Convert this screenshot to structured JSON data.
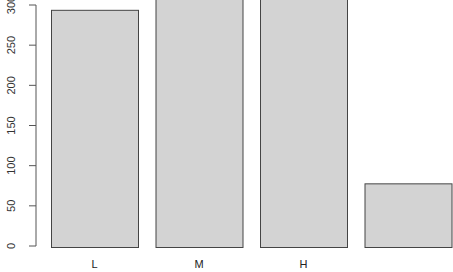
{
  "chart_data": {
    "type": "bar",
    "title": "",
    "xlabel": "",
    "ylabel": "",
    "categories": [
      "L",
      "M",
      "H",
      ""
    ],
    "values": [
      294,
      310,
      308,
      78
    ],
    "ylim": [
      0,
      300
    ],
    "yticks": [
      0,
      50,
      100,
      150,
      200,
      250,
      300
    ],
    "grid": false,
    "legend": null,
    "bar_fill": "#d3d3d3",
    "bar_stroke": "#444444"
  }
}
